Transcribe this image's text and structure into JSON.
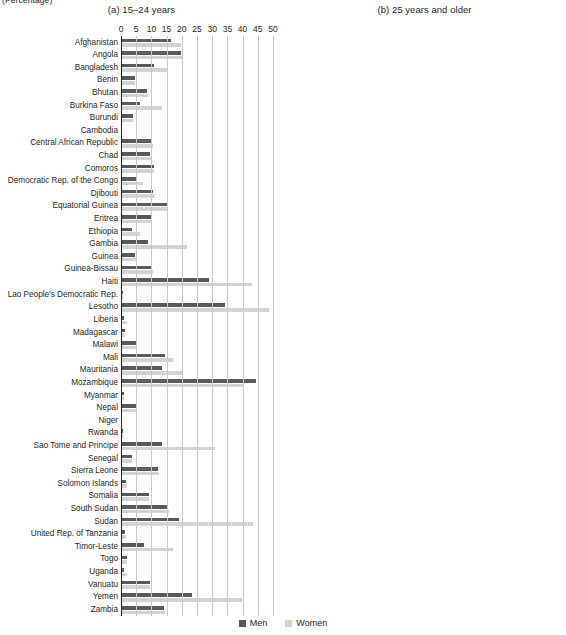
{
  "unit_label": "(Percentage)",
  "legend": {
    "men_label": "Men",
    "women_label": "Women",
    "men_color": "#58595b",
    "women_color": "#d3d3d3"
  },
  "chart_data": {
    "type": "bar",
    "orientation": "horizontal",
    "title": "",
    "xlabel": "(Percentage)",
    "ylabel": "",
    "xlim": [
      0,
      50
    ],
    "xticks": [
      0,
      5,
      10,
      15,
      20,
      25,
      30,
      35,
      40,
      45,
      50
    ],
    "grid": true,
    "legend_position": "bottom-center",
    "legend_entries": [
      "Men",
      "Women"
    ],
    "categories": [
      "Afghanistan",
      "Angola",
      "Bangladesh",
      "Benin",
      "Bhutan",
      "Burkina Faso",
      "Burundi",
      "Cambodia",
      "Central African Republic",
      "Chad",
      "Comoros",
      "Democratic Rep. of the Congo",
      "Djibouti",
      "Equatorial Guinea",
      "Eritrea",
      "Ethiopia",
      "Gambia",
      "Guinea",
      "Guinea-Bissau",
      "Haiti",
      "Lao People's Democratic Rep.",
      "Lesotho",
      "Liberia",
      "Madagascar",
      "Malawi",
      "Mali",
      "Mauritania",
      "Mozambique",
      "Myanmar",
      "Nepal",
      "Niger",
      "Rwanda",
      "Sao Tome and Principe",
      "Senegal",
      "Sierra Leone",
      "Solomon Islands",
      "Somalia",
      "South Sudan",
      "Sudan",
      "United Rep. of Tanzania",
      "Timor-Leste",
      "Togo",
      "Uganda",
      "Vanuatu",
      "Yemen",
      "Zambia"
    ],
    "panels": [
      {
        "key": "a",
        "title": "(a) 15–24 years",
        "series": [
          {
            "name": "Men",
            "values": [
              16.5,
              19.8,
              11.0,
              4.5,
              8.7,
              6.2,
              3.8,
              0.4,
              10.2,
              9.6,
              10.8,
              5.1,
              10.4,
              15.0,
              10.0,
              3.6,
              8.8,
              4.6,
              10.3,
              29.0,
              0.6,
              34.3,
              1.1,
              1.2,
              4.9,
              14.5,
              13.6,
              44.3,
              0.9,
              4.8,
              0.3,
              0.7,
              13.6,
              3.5,
              12.3,
              1.8,
              9.1,
              15.6,
              19.2,
              1.4,
              7.5,
              2.0,
              1.0,
              9.5,
              23.5,
              14.3
            ]
          },
          {
            "name": "Women",
            "values": [
              19.6,
              20.3,
              15.0,
              4.6,
              9.0,
              13.5,
              3.9,
              0.4,
              10.4,
              10.1,
              10.9,
              7.2,
              10.7,
              15.2,
              10.2,
              6.3,
              21.7,
              4.8,
              10.5,
              43.0,
              0.7,
              48.8,
              2.1,
              1.3,
              5.0,
              17.0,
              20.0,
              40.0,
              1.0,
              4.9,
              0.4,
              0.8,
              31.0,
              3.6,
              12.5,
              2.0,
              9.3,
              15.8,
              43.3,
              1.5,
              17.0,
              2.1,
              1.9,
              9.7,
              39.8,
              14.5
            ]
          }
        ]
      },
      {
        "key": "b",
        "title": "(b) 25 years and older",
        "series": [
          {
            "name": "Men",
            "values": [
              5.4,
              5.8,
              2.2,
              1.6,
              1.5,
              5.2,
              1.4,
              0.2,
              5.5,
              5.3,
              4.9,
              1.5,
              3.9,
              8.8,
              4.2,
              1.3,
              8.6,
              7.8,
              4.5,
              10.8,
              0.3,
              38.0,
              2.4,
              1.2,
              4.4,
              3.9,
              10.2,
              17.0,
              0.4,
              2.6,
              0.2,
              1.0,
              10.6,
              4.5,
              3.6,
              1.2,
              3.8,
              10.4,
              8.5,
              1.2,
              1.9,
              1.8,
              1.1,
              2.6,
              13.9,
              4.1
            ]
          },
          {
            "name": "Women",
            "values": [
              7.7,
              6.5,
              8.4,
              1.8,
              1.7,
              12.0,
              1.5,
              0.2,
              6.2,
              5.7,
              5.1,
              2.3,
              4.1,
              9.1,
              4.4,
              3.4,
              14.7,
              7.9,
              4.7,
              12.2,
              0.4,
              43.0,
              2.5,
              1.3,
              6.3,
              4.7,
              10.5,
              22.0,
              0.5,
              2.7,
              0.3,
              1.1,
              30.2,
              4.7,
              3.8,
              1.3,
              4.0,
              14.2,
              25.5,
              1.7,
              2.2,
              1.9,
              1.9,
              3.0,
              39.6,
              4.3
            ]
          }
        ]
      }
    ]
  }
}
